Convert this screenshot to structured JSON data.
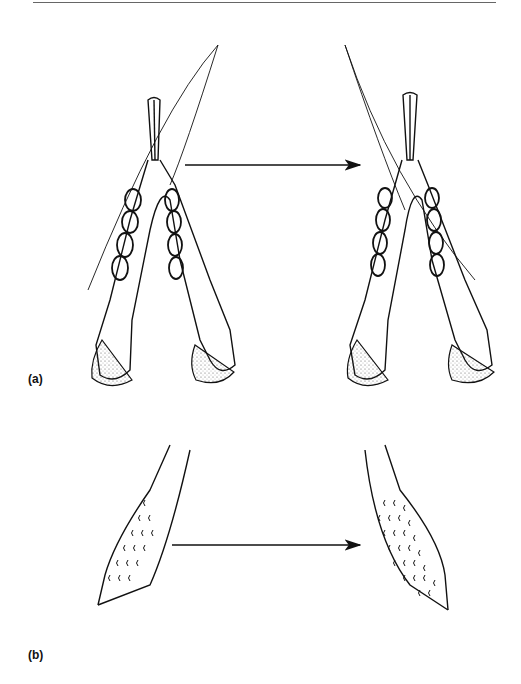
{
  "figure": {
    "panels": [
      {
        "id": "a",
        "label": "(a)",
        "description": "Lower jaws (mandibles) before and after, with overlay outline and arrow indicating transformation"
      },
      {
        "id": "b",
        "label": "(b)",
        "description": "Tapered structure with sparse scale-like marks transforming into a densely patterned structure"
      }
    ],
    "arrow_direction": "left-to-right"
  }
}
